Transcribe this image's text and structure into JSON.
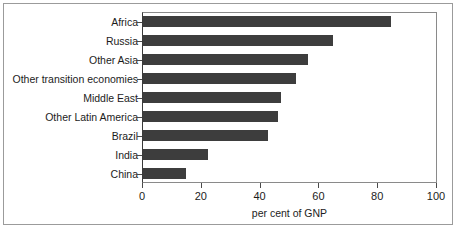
{
  "chart_data": {
    "type": "bar",
    "orientation": "horizontal",
    "title": "",
    "subtitle": "",
    "xlabel": "per cent of GNP",
    "ylabel": "",
    "categories": [
      "Africa",
      "Russia",
      "Other Asia",
      "Other transition economies",
      "Middle East",
      "Other Latin America",
      "Brazil",
      "India",
      "China"
    ],
    "values": [
      84.5,
      64.5,
      56,
      52,
      47,
      46,
      42.5,
      22,
      14.5
    ],
    "xlim": [
      0,
      100
    ],
    "xticks": [
      0,
      20,
      40,
      60,
      80,
      100
    ],
    "xtick_labels": [
      "0",
      "20",
      "40",
      "60",
      "80",
      "100"
    ],
    "grid": false,
    "legend": null,
    "bar_color": "#3d3d3d",
    "frame_color": "#8a8a8a",
    "text_color": "#1c1c1c"
  }
}
